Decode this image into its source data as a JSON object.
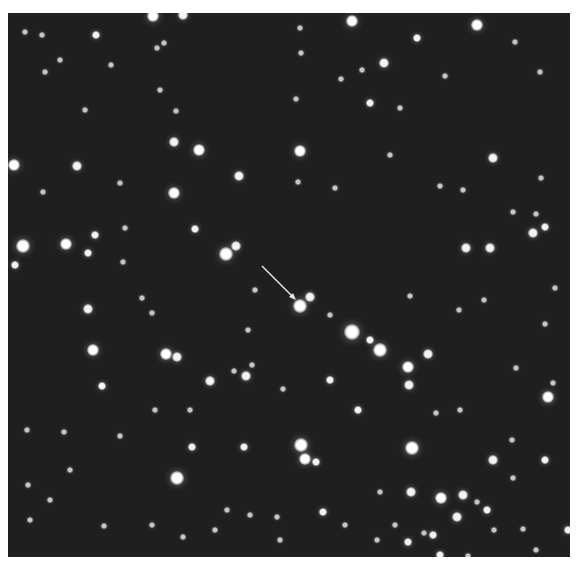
{
  "image": {
    "subject": "star field",
    "background_color": "#1f1f1f",
    "star_color": "#ffffff",
    "arrow_color": "#e8e8e8"
  },
  "arrow": {
    "from": [
      262,
      266
    ],
    "to": [
      293,
      297
    ],
    "target_star": [
      300,
      306
    ]
  },
  "stars": [
    [
      153,
      16,
      6
    ],
    [
      183,
      15,
      5
    ],
    [
      352,
      21,
      6
    ],
    [
      477,
      25,
      6
    ],
    [
      42,
      35,
      3
    ],
    [
      96,
      35,
      4
    ],
    [
      25,
      32,
      3
    ],
    [
      157,
      48,
      3
    ],
    [
      417,
      38,
      4
    ],
    [
      515,
      42,
      3
    ],
    [
      384,
      63,
      5
    ],
    [
      60,
      60,
      3
    ],
    [
      45,
      72,
      3
    ],
    [
      164,
      43,
      3
    ],
    [
      301,
      53,
      3
    ],
    [
      341,
      79,
      3
    ],
    [
      362,
      70,
      3
    ],
    [
      445,
      76,
      3
    ],
    [
      540,
      72,
      3
    ],
    [
      111,
      65,
      3
    ],
    [
      176,
      111,
      3
    ],
    [
      174,
      142,
      5
    ],
    [
      199,
      150,
      6
    ],
    [
      14,
      165,
      6
    ],
    [
      77,
      166,
      5
    ],
    [
      239,
      176,
      5
    ],
    [
      300,
      151,
      6
    ],
    [
      298,
      182,
      3
    ],
    [
      493,
      158,
      5
    ],
    [
      513,
      212,
      3
    ],
    [
      174,
      193,
      6
    ],
    [
      43,
      192,
      3
    ],
    [
      95,
      235,
      4
    ],
    [
      195,
      229,
      4
    ],
    [
      125,
      228,
      3
    ],
    [
      226,
      254,
      7
    ],
    [
      236,
      246,
      5
    ],
    [
      296,
      99,
      3
    ],
    [
      370,
      103,
      4
    ],
    [
      400,
      108,
      3
    ],
    [
      300,
      28,
      3
    ],
    [
      541,
      178,
      3
    ],
    [
      466,
      248,
      5
    ],
    [
      490,
      248,
      5
    ],
    [
      533,
      233,
      5
    ],
    [
      545,
      227,
      4
    ],
    [
      536,
      214,
      3
    ],
    [
      23,
      246,
      7
    ],
    [
      66,
      244,
      6
    ],
    [
      88,
      253,
      4
    ],
    [
      15,
      265,
      4
    ],
    [
      300,
      306,
      7
    ],
    [
      310,
      297,
      5
    ],
    [
      410,
      296,
      3
    ],
    [
      88,
      309,
      5
    ],
    [
      152,
      313,
      3
    ],
    [
      459,
      310,
      3
    ],
    [
      484,
      300,
      3
    ],
    [
      352,
      332,
      8
    ],
    [
      380,
      350,
      7
    ],
    [
      370,
      340,
      4
    ],
    [
      428,
      354,
      5
    ],
    [
      408,
      367,
      6
    ],
    [
      93,
      350,
      6
    ],
    [
      166,
      354,
      6
    ],
    [
      177,
      357,
      5
    ],
    [
      330,
      315,
      3
    ],
    [
      248,
      330,
      3
    ],
    [
      545,
      324,
      3
    ],
    [
      553,
      383,
      3
    ],
    [
      548,
      397,
      6
    ],
    [
      516,
      368,
      3
    ],
    [
      409,
      385,
      5
    ],
    [
      436,
      413,
      3
    ],
    [
      460,
      410,
      3
    ],
    [
      210,
      381,
      5
    ],
    [
      246,
      376,
      5
    ],
    [
      234,
      371,
      3
    ],
    [
      252,
      365,
      3
    ],
    [
      102,
      386,
      4
    ],
    [
      283,
      389,
      3
    ],
    [
      330,
      380,
      4
    ],
    [
      358,
      410,
      4
    ],
    [
      155,
      410,
      3
    ],
    [
      190,
      410,
      3
    ],
    [
      27,
      430,
      3
    ],
    [
      64,
      432,
      3
    ],
    [
      120,
      436,
      3
    ],
    [
      301,
      445,
      7
    ],
    [
      305,
      459,
      6
    ],
    [
      316,
      462,
      4
    ],
    [
      412,
      448,
      7
    ],
    [
      177,
      478,
      7
    ],
    [
      192,
      447,
      4
    ],
    [
      244,
      447,
      4
    ],
    [
      493,
      460,
      5
    ],
    [
      545,
      460,
      4
    ],
    [
      513,
      478,
      3
    ],
    [
      441,
      498,
      6
    ],
    [
      463,
      495,
      5
    ],
    [
      477,
      502,
      3
    ],
    [
      411,
      492,
      5
    ],
    [
      380,
      492,
      3
    ],
    [
      227,
      510,
      3
    ],
    [
      323,
      512,
      4
    ],
    [
      277,
      517,
      3
    ],
    [
      457,
      517,
      5
    ],
    [
      487,
      510,
      4
    ],
    [
      494,
      530,
      3
    ],
    [
      523,
      529,
      3
    ],
    [
      424,
      533,
      3
    ],
    [
      433,
      535,
      4
    ],
    [
      377,
      540,
      3
    ],
    [
      395,
      525,
      3
    ],
    [
      408,
      542,
      4
    ],
    [
      50,
      500,
      3
    ],
    [
      104,
      526,
      3
    ],
    [
      28,
      485,
      3
    ],
    [
      152,
      525,
      3
    ],
    [
      183,
      537,
      3
    ],
    [
      215,
      530,
      3
    ],
    [
      440,
      555,
      4
    ],
    [
      468,
      556,
      3
    ],
    [
      568,
      530,
      4
    ],
    [
      536,
      550,
      3
    ],
    [
      280,
      540,
      3
    ],
    [
      250,
      515,
      3
    ],
    [
      345,
      525,
      3
    ],
    [
      123,
      262,
      3
    ],
    [
      142,
      298,
      3
    ],
    [
      255,
      290,
      3
    ],
    [
      120,
      183,
      3
    ],
    [
      463,
      190,
      3
    ],
    [
      440,
      186,
      3
    ],
    [
      335,
      188,
      3
    ],
    [
      390,
      155,
      3
    ],
    [
      160,
      90,
      3
    ],
    [
      85,
      110,
      3
    ],
    [
      555,
      288,
      3
    ],
    [
      512,
      440,
      3
    ],
    [
      70,
      470,
      3
    ],
    [
      30,
      520,
      3
    ]
  ]
}
